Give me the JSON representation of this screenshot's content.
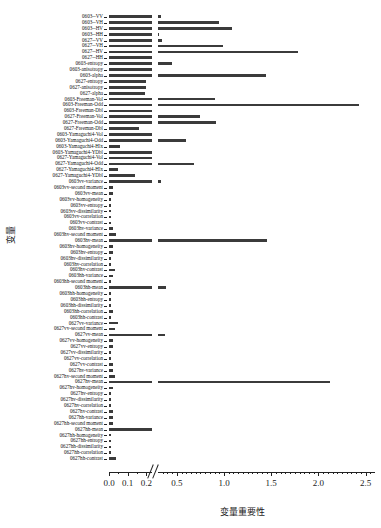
{
  "chart_data": {
    "type": "bar",
    "orientation": "horizontal",
    "title": "",
    "xlabel": "变量重要性",
    "ylabel": "变量",
    "xlim": [
      0.0,
      2.6
    ],
    "grid": false,
    "legend": null,
    "axis_break": {
      "present": true,
      "from": 0.23,
      "to": 0.3,
      "marker": "//"
    },
    "xticks_major": [
      "0.0",
      "0.1",
      "0.2",
      "0.5",
      "1.0",
      "1.5",
      "2.0",
      "2.5"
    ],
    "xtick_values": [
      0.0,
      0.1,
      0.2,
      0.5,
      1.0,
      1.5,
      2.0,
      2.5
    ],
    "bar_color": "#3b3b3b",
    "categories": [
      "0603--VV",
      "0603--VH",
      "0603--HV",
      "0603--HH",
      "0627--VV",
      "0627--VH",
      "0627--HV",
      "0627--HH",
      "0603-entropy",
      "0603-anisotropy",
      "0603-alpha",
      "0627-entropy",
      "0627-anisotropy",
      "0627-alpha",
      "0603-Freeman-Vol",
      "0603-Freeman-Odd",
      "0603-Freeman-Dbl",
      "0627-Freeman-Vol",
      "0627-Freeman-Odd",
      "0627-Freeman-Dbl",
      "0603-Yamaguchi4-Vol",
      "0603-Yamaguchi4-Odd",
      "0603-Yamaguchi4-Hlx",
      "0603-Yamaguchi4-YDbl",
      "0627-Yamaguchi4-Vol",
      "0627-Yamaguchi4-Odd",
      "0627-Yamaguchi4-Hlx",
      "0627-Yamaguchi4-YDbl",
      "0603vv-variance",
      "0603vv-second moment",
      "0603vv-mean",
      "0603vv-homogeneity",
      "0603vv-entropy",
      "0603vv-dissimilarity",
      "0603vv-correlation",
      "0603vv-contrast",
      "0603hv-variance",
      "0603hv-second moment",
      "0603hv-mean",
      "0603hv-homogeneity",
      "0603hv-entropy",
      "0603hv-dissimilarity",
      "0603hv-correlation",
      "0603hv-contrast",
      "0603hh-variance",
      "0603hh-second moment",
      "0603hh-mean",
      "0603hh-homogeneity",
      "0603hh-entropy",
      "0603hh-dissimilarity",
      "0603hh-correlation",
      "0603hh-contrast",
      "0627vv-variance",
      "0627vv-second moment",
      "0627vv-mean",
      "0627vv-homogeneity",
      "0627vv-entropy",
      "0627vv-dissimilarity",
      "0627vv-correlation",
      "0627vv-contrast",
      "0627hv-variance",
      "0627hv-second moment",
      "0627hv-mean",
      "0627hv-homogeneity",
      "0627hv-entropy",
      "0627hv-dissimilarity",
      "0627hv-correlation",
      "0627hv-contrast",
      "0627hh-variance",
      "0627hh-second moment",
      "0627hh-mean",
      "0627hh-homogeneity",
      "0627hh-entropy",
      "0627hh-dissimilarity",
      "0627hh-correlation",
      "0627hh-contrast"
    ],
    "values": [
      0.33,
      0.95,
      1.08,
      0.31,
      0.34,
      0.99,
      1.78,
      0.23,
      0.45,
      0.3,
      1.44,
      0.2,
      0.2,
      0.19,
      0.9,
      2.43,
      0.25,
      0.74,
      0.92,
      0.16,
      0.23,
      0.6,
      0.06,
      0.23,
      0.25,
      0.68,
      0.05,
      0.14,
      0.33,
      0.02,
      0.02,
      0.01,
      0.01,
      0.01,
      0.01,
      0.01,
      0.02,
      0.04,
      1.46,
      0.02,
      0.02,
      0.01,
      0.01,
      0.03,
      0.02,
      0.01,
      0.38,
      0.01,
      0.01,
      0.01,
      0.02,
      0.01,
      0.05,
      0.03,
      0.37,
      0.02,
      0.02,
      0.01,
      0.01,
      0.02,
      0.02,
      0.03,
      2.12,
      0.02,
      0.01,
      0.01,
      0.01,
      0.02,
      0.02,
      0.02,
      0.29,
      0.01,
      0.01,
      0.01,
      0.01,
      0.04
    ]
  }
}
